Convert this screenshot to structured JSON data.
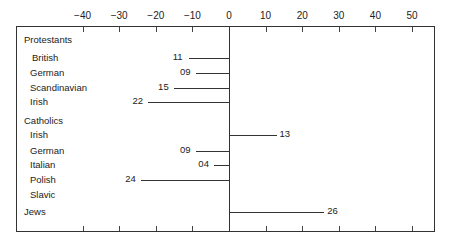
{
  "chart_data": {
    "type": "bar",
    "orientation": "horizontal",
    "title": "",
    "xlabel": "",
    "ylabel": "",
    "xlim": [
      -55,
      56
    ],
    "x_ticks": [
      -40,
      -30,
      -20,
      -10,
      0,
      10,
      20,
      30,
      40,
      50
    ],
    "x_tick_labels": [
      "−40",
      "−30",
      "−20",
      "−10",
      "0",
      "10",
      "20",
      "30",
      "40",
      "50"
    ],
    "grid": false,
    "legend": null,
    "groups": [
      {
        "name": "Protestants",
        "items": [
          {
            "label": "British",
            "value": -11,
            "value_label": "11"
          },
          {
            "label": "German",
            "value": -9,
            "value_label": "09"
          },
          {
            "label": "Scandinavian",
            "value": -15,
            "value_label": "15"
          },
          {
            "label": "Irish",
            "value": -22,
            "value_label": "22"
          }
        ]
      },
      {
        "name": "Catholics",
        "items": [
          {
            "label": "Irish",
            "value": 13,
            "value_label": "13"
          },
          {
            "label": "German",
            "value": -9,
            "value_label": "09"
          },
          {
            "label": "Italian",
            "value": -4,
            "value_label": "04"
          },
          {
            "label": "Polish",
            "value": -24,
            "value_label": "24"
          },
          {
            "label": "Slavic",
            "value": null,
            "value_label": ""
          }
        ]
      },
      {
        "name": "Jews",
        "items": [
          {
            "label": "",
            "value": 26,
            "value_label": "26"
          }
        ]
      }
    ],
    "categories": [
      "Protestants British",
      "Protestants German",
      "Protestants Scandinavian",
      "Protestants Irish",
      "Catholics Irish",
      "Catholics German",
      "Catholics Italian",
      "Catholics Polish",
      "Catholics Slavic",
      "Jews"
    ],
    "values": [
      -11,
      -9,
      -15,
      -22,
      13,
      -9,
      -4,
      -24,
      null,
      26
    ]
  },
  "layout": {
    "zero_x": 229,
    "px_per_unit": 3.66,
    "rows": [
      {
        "kind": "group",
        "label": "Protestants",
        "y": 40
      },
      {
        "kind": "item",
        "label": "British",
        "y": 58,
        "value": -11,
        "value_label": "11",
        "indent": 32
      },
      {
        "kind": "item",
        "label": "German",
        "y": 73,
        "value": -9,
        "value_label": "09",
        "indent": 30
      },
      {
        "kind": "item",
        "label": "Scandinavian",
        "y": 88,
        "value": -15,
        "value_label": "15",
        "indent": 30
      },
      {
        "kind": "item",
        "label": "Irish",
        "y": 102,
        "value": -22,
        "value_label": "22",
        "indent": 30
      },
      {
        "kind": "group",
        "label": "Catholics",
        "y": 121
      },
      {
        "kind": "item",
        "label": "Irish",
        "y": 135,
        "value": 13,
        "value_label": "13",
        "indent": 30
      },
      {
        "kind": "item",
        "label": "German",
        "y": 151,
        "value": -9,
        "value_label": "09",
        "indent": 30
      },
      {
        "kind": "item",
        "label": "Italian",
        "y": 165,
        "value": -4,
        "value_label": "04",
        "indent": 30
      },
      {
        "kind": "item",
        "label": "Polish",
        "y": 180,
        "value": -24,
        "value_label": "24",
        "indent": 30
      },
      {
        "kind": "item",
        "label": "Slavic",
        "y": 195,
        "value": null,
        "value_label": "",
        "indent": 30
      },
      {
        "kind": "group",
        "label": "Jews",
        "y": 212,
        "value": 26,
        "value_label": "26"
      }
    ]
  }
}
